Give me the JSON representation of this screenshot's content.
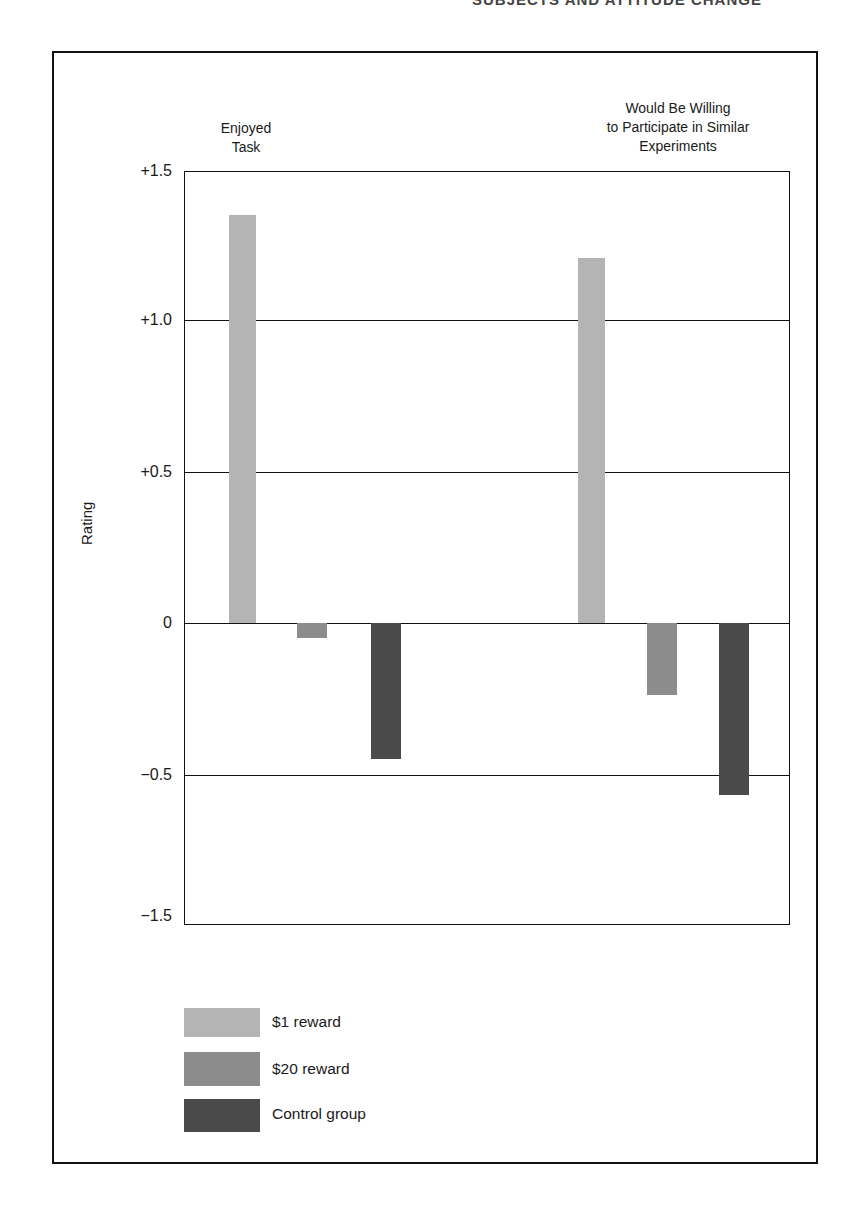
{
  "page": {
    "running_head": "SUBJECTS AND ATTITUDE CHANGE"
  },
  "chart_data": {
    "type": "bar",
    "title": "",
    "xlabel": "",
    "ylabel": "Rating",
    "ylim": [
      -1.5,
      1.5
    ],
    "yticks": [
      "+1.5",
      "+1.0",
      "+0.5",
      "0",
      "−0.5",
      "−1.5"
    ],
    "grid": true,
    "legend_position": "bottom-left",
    "categories": [
      "Enjoyed Task",
      "Would Be Willing to Participate in Similar Experiments"
    ],
    "category_titles": [
      [
        "Enjoyed",
        "Task"
      ],
      [
        "Would Be Willing",
        "to Participate in Similar",
        "Experiments"
      ]
    ],
    "series": [
      {
        "name": "$1 reward",
        "color": "#b4b4b4",
        "values": [
          1.35,
          1.21
        ]
      },
      {
        "name": "$20 reward",
        "color": "#8c8c8c",
        "values": [
          -0.05,
          -0.24
        ]
      },
      {
        "name": "Control group",
        "color": "#4a4a4a",
        "values": [
          -0.45,
          -0.57
        ]
      }
    ]
  },
  "legend": {
    "items": [
      {
        "label": "$1 reward",
        "color": "#b4b4b4"
      },
      {
        "label": "$20 reward",
        "color": "#8c8c8c"
      },
      {
        "label": "Control group",
        "color": "#4a4a4a"
      }
    ]
  }
}
